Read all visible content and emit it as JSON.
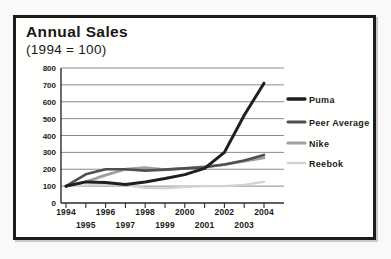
{
  "card": {
    "title": "Annual Sales",
    "subtitle": "(1994 = 100)"
  },
  "chart_data": {
    "type": "line",
    "title": "Annual Sales",
    "subtitle": "(1994 = 100)",
    "x": [
      1994,
      1995,
      1996,
      1997,
      1998,
      1999,
      2000,
      2001,
      2002,
      2003,
      2004
    ],
    "ylim": [
      0,
      800
    ],
    "ytick_step": 100,
    "grid": true,
    "legend_position": "right",
    "x_tick_rows": {
      "top": [
        1994,
        1996,
        1998,
        2000,
        2002,
        2004
      ],
      "bottom": [
        1995,
        1997,
        1999,
        2001,
        2003
      ]
    },
    "series": [
      {
        "name": "Puma",
        "color": "#1f1f1f",
        "stroke_width": 3.0,
        "values": [
          100,
          125,
          122,
          110,
          125,
          145,
          168,
          205,
          300,
          520,
          710
        ]
      },
      {
        "name": "Peer Average",
        "color": "#4f4f4f",
        "stroke_width": 2.6,
        "values": [
          100,
          170,
          200,
          200,
          192,
          198,
          205,
          212,
          228,
          252,
          285
        ]
      },
      {
        "name": "Nike",
        "color": "#a0a0a0",
        "stroke_width": 2.8,
        "values": [
          100,
          125,
          165,
          200,
          210,
          198,
          205,
          215,
          228,
          248,
          268
        ]
      },
      {
        "name": "Reebok",
        "color": "#d2d2d2",
        "stroke_width": 2.2,
        "values": [
          100,
          105,
          107,
          105,
          90,
          87,
          95,
          100,
          100,
          107,
          125
        ]
      }
    ]
  }
}
